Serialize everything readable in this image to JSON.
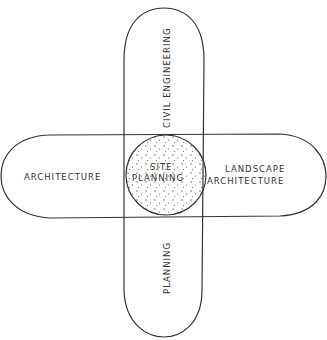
{
  "diagram": {
    "type": "overlapping-discipline-diagram",
    "center": {
      "label_line1": "SITE",
      "label_line2": "PLANNING",
      "fill": "stippled"
    },
    "disciplines": [
      {
        "id": "civil-engineering",
        "label": "CIVIL ENGINEERING",
        "position": "top",
        "orientation": "vertical"
      },
      {
        "id": "architecture",
        "label": "ARCHITECTURE",
        "position": "left",
        "orientation": "horizontal"
      },
      {
        "id": "landscape-architecture",
        "label_line1": "LANDSCAPE",
        "label_line2": "ARCHITECTURE",
        "position": "right",
        "orientation": "horizontal"
      },
      {
        "id": "planning",
        "label": "PLANNING",
        "position": "bottom",
        "orientation": "vertical"
      }
    ],
    "colors": {
      "stroke": "#333333",
      "background": "#ffffff",
      "dots": "#444444"
    }
  }
}
